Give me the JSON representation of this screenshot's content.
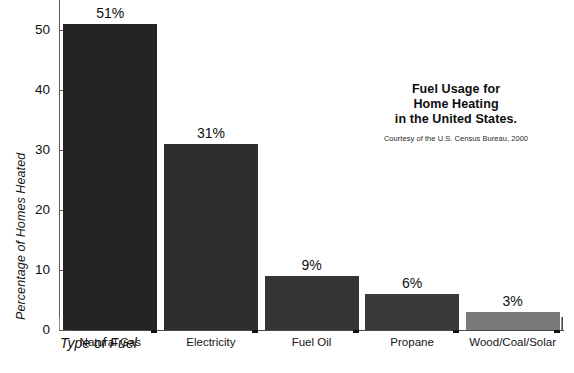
{
  "chart_data": {
    "type": "bar",
    "title": "Fuel Usage for Home Heating in the United States.",
    "title_lines": [
      "Fuel Usage for",
      "Home Heating",
      "in the United States."
    ],
    "credit": "Courtesy of the U.S. Census Bureau, 2000",
    "xlabel": "Type of Fuel",
    "ylabel": "Percentage of Homes Heated",
    "categories": [
      "Natural Gas",
      "Electricity",
      "Fuel Oil",
      "Propane",
      "Wood/Coal/Solar"
    ],
    "values": [
      51,
      31,
      9,
      6,
      3
    ],
    "value_labels": [
      "51%",
      "31%",
      "9%",
      "6%",
      "3%"
    ],
    "ylim": [
      0,
      55
    ],
    "yticks": [
      0,
      10,
      20,
      30,
      40,
      50
    ],
    "ytick_labels": [
      "0",
      "10",
      "20",
      "30",
      "40",
      "50"
    ],
    "grid": false,
    "legend": "none",
    "bar_colors": [
      "#242424",
      "#2e2e2e",
      "#353535",
      "#3a3a3a",
      "#7a7a7a"
    ],
    "shadow_color": "#111111"
  },
  "colors": {
    "background": "#ffffff",
    "axis": "#5d5d5d",
    "text": "#141414"
  }
}
